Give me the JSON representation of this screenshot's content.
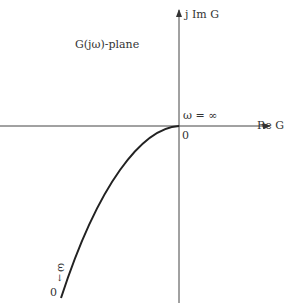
{
  "diagram": {
    "plane_label": "G(jω)-plane",
    "imag_axis_label": "j Im G",
    "real_axis_label": "Re G",
    "origin_label": "0",
    "omega_inf_label": "ω = ∞",
    "omega_label": "ω",
    "omega_arrow": "↓",
    "omega_zero_label": "0",
    "colors": {
      "line": "#333333",
      "curve": "#222222"
    }
  }
}
